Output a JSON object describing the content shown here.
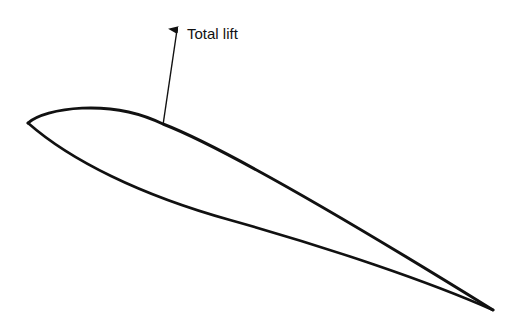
{
  "diagram": {
    "labels": {
      "lift_arrow": "Total lift"
    },
    "colors": {
      "stroke": "#111111",
      "background": "#ffffff"
    }
  }
}
